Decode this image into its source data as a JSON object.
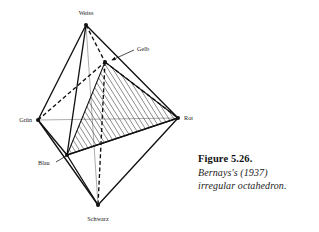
{
  "figure": {
    "vertices": [
      {
        "key": "weiss",
        "label": "Weiss",
        "x": 86,
        "y": 25,
        "label_x": 86,
        "label_y": 15,
        "anchor": "middle"
      },
      {
        "key": "gelb",
        "label": "Gelb",
        "x": 105,
        "y": 62,
        "label_x": 137,
        "label_y": 51,
        "anchor": "start"
      },
      {
        "key": "gruen",
        "label": "Grün",
        "x": 38,
        "y": 120,
        "label_x": 32,
        "label_y": 122,
        "anchor": "end"
      },
      {
        "key": "rot",
        "label": "Rot",
        "x": 178,
        "y": 118,
        "label_x": 184,
        "label_y": 120,
        "anchor": "start"
      },
      {
        "key": "blau",
        "label": "Blau",
        "x": 67,
        "y": 155,
        "label_x": 38,
        "label_y": 165,
        "anchor": "start"
      },
      {
        "key": "schwarz",
        "label": "Schwarz",
        "x": 98,
        "y": 205,
        "label_x": 98,
        "label_y": 221,
        "anchor": "middle"
      }
    ],
    "solid_edges": [
      [
        "weiss",
        "gruen"
      ],
      [
        "weiss",
        "blau"
      ],
      [
        "weiss",
        "rot"
      ],
      [
        "gruen",
        "blau"
      ],
      [
        "gruen",
        "schwarz"
      ],
      [
        "blau",
        "rot"
      ],
      [
        "blau",
        "schwarz"
      ],
      [
        "rot",
        "schwarz"
      ]
    ],
    "dashed_edges": [
      [
        "weiss",
        "gelb"
      ],
      [
        "gruen",
        "gelb"
      ],
      [
        "gelb",
        "rot"
      ],
      [
        "gelb",
        "schwarz"
      ]
    ],
    "hatched_face": [
      "gelb",
      "rot",
      "blau"
    ],
    "axis_lines": [
      {
        "name": "vertical-axis",
        "x1": 86,
        "y1": 25,
        "x2": 98,
        "y2": 205
      },
      {
        "name": "horizontal-axis",
        "x1": 38,
        "y1": 120,
        "x2": 178,
        "y2": 118
      }
    ],
    "leader_lines": [
      {
        "name": "gelb-leader",
        "x1": 134,
        "y1": 50,
        "x2": 112,
        "y2": 60,
        "arrow": true
      },
      {
        "name": "blau-leader",
        "x1": 56,
        "y1": 162,
        "x2": 66,
        "y2": 156,
        "arrow": false
      }
    ],
    "colors": {
      "stroke": "#111111",
      "axis": "#8a8a8a",
      "hatch": "#1a1a1a",
      "label": "#1a1a1a",
      "background": "#ffffff"
    }
  },
  "caption": {
    "title": "Figure 5.26.",
    "line1": "Bernays's (1937)",
    "line2": "irregular octahedron."
  }
}
